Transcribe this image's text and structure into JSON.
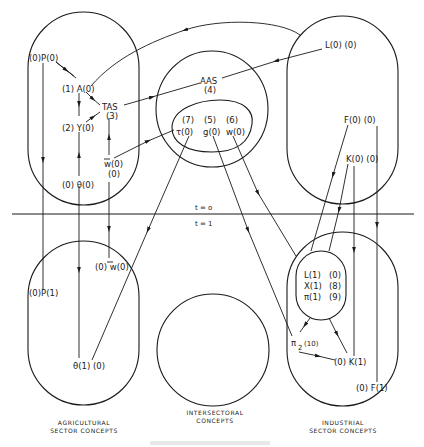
{
  "time_divider": {
    "above": "t = o",
    "below": "t = 1"
  },
  "sectors": {
    "agricultural": {
      "line1": "AGRICULTURAL",
      "line2": "SECTOR   CONCEPTS"
    },
    "intersectoral": {
      "line1": "INTERSECTORAL",
      "line2": "CONCEPTS"
    },
    "industrial": {
      "line1": "INDUSTRIAL",
      "line2": "SECTOR   CONCEPTS"
    }
  },
  "nodes": {
    "P0": "(0)P(0)",
    "A0": "(1)  A(0)",
    "TAS": "TAS",
    "TAS_order": "(3)",
    "Y0": "(2)  Y(0)",
    "wbar0": "w(0)",
    "wbar0_order": "(0)",
    "theta0": "(0)  θ(0)",
    "AAS": "AAS",
    "AAS_order": "(4)",
    "tau_order": "(7)",
    "g_order": "(5)",
    "w_order": "(6)",
    "tau0": "τ(0)",
    "g0": "g(0)",
    "w0": "w(0)",
    "L0": "L(0) (0)",
    "F0": "F(0)  (0)",
    "K0": "K(0) (0)",
    "P1": "(0)P(1)",
    "wbar1": "(0) w(0)",
    "theta1": "θ(1)  (0)",
    "L1": "L(1)",
    "L1_order": "(0)",
    "X1": "X(1)",
    "X1_order": "(8)",
    "pi1": "π(1)",
    "pi1_order": "(9)",
    "pi2": "π",
    "pi2_sub": "2",
    "pi2_order": "(10)",
    "K1": "(0) K(1)",
    "F1": "(0) F(1)"
  },
  "colors": {
    "ink": "#1a1a1a",
    "background": "#ffffff"
  }
}
